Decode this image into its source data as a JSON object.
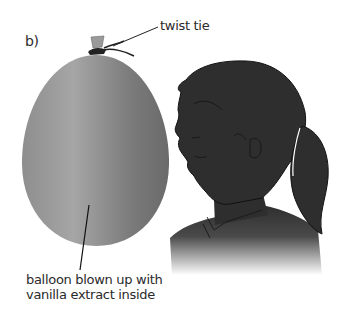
{
  "figure": {
    "panel_label": "b)",
    "annotations": [
      {
        "id": "twist-tie",
        "text": "twist tie"
      },
      {
        "id": "balloon",
        "lines": [
          "balloon blown up with",
          "vanilla extract inside"
        ]
      }
    ]
  },
  "colors": {
    "balloon_light": "#a0a0a0",
    "balloon_dark": "#666666",
    "silhouette": "#2e2e2e",
    "outline": "#111111",
    "text": "#2a2a2a",
    "background": "#ffffff"
  },
  "icons": [
    "balloon-illustration",
    "twist-tie-knot",
    "person-head-silhouette",
    "ponytail"
  ]
}
